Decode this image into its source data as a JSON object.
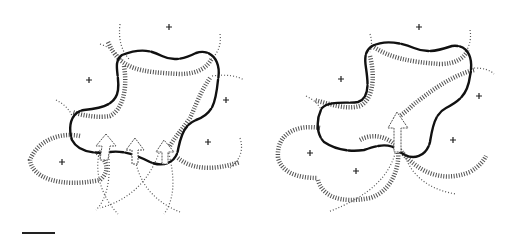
{
  "figure": {
    "panels": [
      {
        "id": "left",
        "plus_markers": [
          [
            169,
            27
          ],
          [
            89,
            80
          ],
          [
            226,
            100
          ],
          [
            208,
            142
          ],
          [
            62,
            162
          ]
        ],
        "arrow_count": 3
      },
      {
        "id": "right",
        "plus_markers": [
          [
            419,
            27
          ],
          [
            341,
            79
          ],
          [
            479,
            96
          ],
          [
            453,
            140
          ],
          [
            310,
            153
          ],
          [
            356,
            171
          ]
        ],
        "arrow_count": 1
      }
    ],
    "scale_bar": {
      "x1": 22,
      "x2": 55,
      "y": 233
    },
    "colors": {
      "outline": "#111111",
      "hatch": "#333333",
      "background": "#ffffff"
    }
  }
}
